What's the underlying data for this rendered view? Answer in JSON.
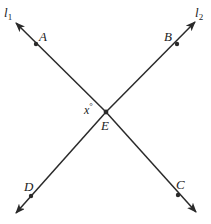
{
  "diagram": {
    "type": "intersecting-lines",
    "colors": {
      "line": "#2a2a2a",
      "text": "#222222",
      "background": "#ffffff"
    },
    "lines": [
      {
        "name": "l",
        "subscript": "1",
        "from": [
          16,
          23
        ],
        "to": [
          196,
          212
        ],
        "points": [
          "A",
          "E",
          "C"
        ]
      },
      {
        "name": "l",
        "subscript": "2",
        "from": [
          195,
          22
        ],
        "to": [
          16,
          213
        ],
        "points": [
          "B",
          "E",
          "D"
        ]
      }
    ],
    "points": {
      "A": {
        "label": "A",
        "pos": [
          36,
          44
        ]
      },
      "B": {
        "label": "B",
        "pos": [
          177,
          44
        ]
      },
      "C": {
        "label": "C",
        "pos": [
          178,
          195
        ]
      },
      "D": {
        "label": "D",
        "pos": [
          31,
          196
        ]
      },
      "E": {
        "label": "E",
        "pos": [
          106,
          112
        ]
      }
    },
    "angle": {
      "label": "x",
      "degree_symbol": "°",
      "between": [
        "A",
        "E",
        "D"
      ]
    }
  }
}
